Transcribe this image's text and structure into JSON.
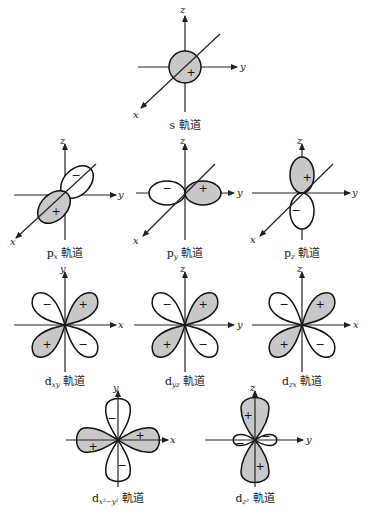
{
  "figure": {
    "fill_color": "#c8c8c8",
    "line_color": "#111111"
  },
  "orbitals": {
    "s": {
      "prefix": "s",
      "subscript": "",
      "suffix": " 軌道",
      "axes": [
        "z",
        "y",
        "x"
      ],
      "signs": [
        "+"
      ]
    },
    "px": {
      "prefix": "p",
      "subscript": "x",
      "suffix": " 軌道",
      "axes": [
        "z",
        "y",
        "x"
      ],
      "signs": [
        "+",
        "−"
      ]
    },
    "py": {
      "prefix": "p",
      "subscript": "y",
      "suffix": " 軌道",
      "axes": [
        "z",
        "y",
        "x"
      ],
      "signs": [
        "+",
        "−"
      ]
    },
    "pz": {
      "prefix": "p",
      "subscript": "z",
      "suffix": " 軌道",
      "axes": [
        "z",
        "y",
        "x"
      ],
      "signs": [
        "+",
        "−"
      ]
    },
    "dxy": {
      "prefix": "d",
      "subscript": "xy",
      "suffix": " 軌道",
      "axes": [
        "y",
        "x"
      ],
      "signs": [
        "+",
        "−",
        "+",
        "−"
      ]
    },
    "dyz": {
      "prefix": "d",
      "subscript": "yz",
      "suffix": " 軌道",
      "axes": [
        "z",
        "y"
      ],
      "signs": [
        "+",
        "−",
        "+",
        "−"
      ]
    },
    "dzx": {
      "prefix": "d",
      "subscript": "zx",
      "suffix": " 軌道",
      "axes": [
        "z",
        "x"
      ],
      "signs": [
        "+",
        "−",
        "+",
        "−"
      ]
    },
    "dx2y2": {
      "prefix": "d",
      "subscript": "x²−y²",
      "suffix": " 軌道",
      "axes": [
        "y",
        "x"
      ],
      "signs": [
        "+",
        "−",
        "+",
        "−"
      ]
    },
    "dz2": {
      "prefix": "d",
      "subscript": "z²",
      "suffix": " 軌道",
      "axes": [
        "z",
        "y"
      ],
      "signs": [
        "+",
        "−",
        "+",
        "−"
      ]
    }
  },
  "signs": {
    "plus": "+",
    "minus": "−"
  }
}
